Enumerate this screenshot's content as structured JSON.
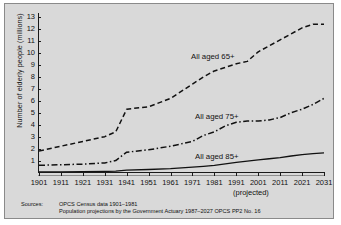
{
  "chart_data": {
    "type": "line",
    "title": "",
    "xlabel": "",
    "ylabel": "Number of elderly people (millions)",
    "xlim": [
      1901,
      2031
    ],
    "ylim": [
      0,
      13.5
    ],
    "grid": false,
    "legend_position": "inline-annotations",
    "xticks": [
      "1901",
      "1911",
      "1921",
      "1931",
      "1941",
      "1951",
      "1961",
      "1971",
      "1981",
      "1991",
      "2001",
      "2011",
      "2021",
      "2031"
    ],
    "yticks": [
      "1",
      "2",
      "3",
      "4",
      "5",
      "6",
      "7",
      "8",
      "9",
      "10",
      "11",
      "12",
      "13"
    ],
    "x": [
      1901,
      1911,
      1921,
      1931,
      1936,
      1941,
      1951,
      1961,
      1971,
      1976,
      1981,
      1986,
      1991,
      1996,
      2001,
      2006,
      2011,
      2016,
      2021,
      2026,
      2031
    ],
    "series": [
      {
        "name": "All aged 65+",
        "style": "dashed",
        "color": "#111111",
        "values": [
          1.8,
          2.2,
          2.6,
          3.0,
          3.4,
          5.3,
          5.5,
          6.2,
          7.4,
          8.0,
          8.5,
          8.8,
          9.1,
          9.3,
          10.1,
          10.6,
          11.1,
          11.6,
          12.1,
          12.4,
          12.4
        ]
      },
      {
        "name": "All aged 75+",
        "style": "dash-dot",
        "color": "#111111",
        "values": [
          0.6,
          0.65,
          0.7,
          0.8,
          1.0,
          1.7,
          1.9,
          2.2,
          2.6,
          3.1,
          3.4,
          3.9,
          4.2,
          4.3,
          4.3,
          4.4,
          4.6,
          5.0,
          5.3,
          5.7,
          6.2
        ]
      },
      {
        "name": "All aged 85+",
        "style": "solid",
        "color": "#111111",
        "values": [
          0.05,
          0.06,
          0.07,
          0.09,
          0.11,
          0.2,
          0.25,
          0.33,
          0.45,
          0.52,
          0.6,
          0.72,
          0.85,
          0.95,
          1.05,
          1.15,
          1.25,
          1.38,
          1.5,
          1.58,
          1.65
        ]
      }
    ],
    "annotations": [
      {
        "text": "(projected)",
        "x": 2011,
        "y": -1.6
      }
    ]
  },
  "axis": {
    "y_title": "Number of elderly people (millions)"
  },
  "labels": {
    "series65": "All aged 65+",
    "series75": "All aged 75+",
    "series85": "All aged 85+",
    "projected": "(projected)"
  },
  "sources": {
    "heading": "Sources:",
    "line1": "OPCS Census data 1901–1981",
    "line2": "Population projections by the Government Actuary 1987–2027 OPCS PP2 No. 16"
  },
  "colors": {
    "background": "#d9d9d9",
    "ink": "#111111",
    "frame": "#8a8a8a"
  }
}
